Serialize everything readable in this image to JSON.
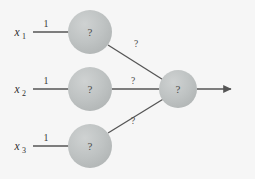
{
  "figure": {
    "name": "neural-network-diagram",
    "background_color": "#f6f6f6",
    "node_fill_color": "#b8bcbc",
    "node_highlight_color": "#cfd2d2",
    "line_color": "#555555",
    "text_color": "#3a3a3a"
  },
  "inputs": [
    {
      "variable": "x",
      "subscript": "1",
      "weight": "1"
    },
    {
      "variable": "x",
      "subscript": "2",
      "weight": "1"
    },
    {
      "variable": "x",
      "subscript": "3",
      "weight": "1"
    }
  ],
  "hidden_nodes": [
    {
      "label": "?"
    },
    {
      "label": "?"
    },
    {
      "label": "?"
    }
  ],
  "hidden_to_output_labels": [
    {
      "label": "?"
    },
    {
      "label": "?"
    },
    {
      "label": "?"
    }
  ],
  "output_node": {
    "label": "?"
  },
  "geometry": {
    "hidden_cx": 90,
    "hidden_r": 22,
    "hidden_cy": [
      32,
      89,
      146
    ],
    "output_cx": 178,
    "output_cy": 89,
    "output_r": 19,
    "input_line_x1": 33,
    "input_line_x2": 68,
    "arrow_x1": 197,
    "arrow_x2": 233
  }
}
